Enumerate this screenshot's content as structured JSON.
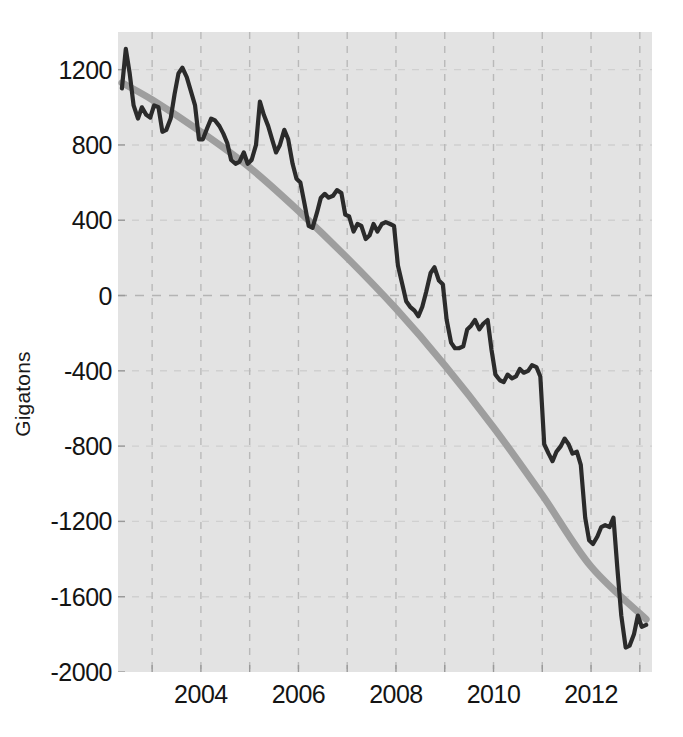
{
  "chart_data": {
    "type": "line",
    "title": "",
    "xlabel": "",
    "ylabel": "Gigatons",
    "xlim": [
      2002.3,
      2013.25
    ],
    "ylim": [
      -2000,
      1400
    ],
    "grid": true,
    "legend_position": "none",
    "x_tick_labels": [
      "2004",
      "2006",
      "2008",
      "2010",
      "2012"
    ],
    "x_tick_values": [
      2004,
      2006,
      2008,
      2010,
      2012
    ],
    "y_tick_labels": [
      "1200",
      "800",
      "400",
      "0",
      "-400",
      "-800",
      "-1200",
      "-1600",
      "-2000"
    ],
    "y_tick_values": [
      1200,
      800,
      400,
      0,
      -400,
      -800,
      -1200,
      -1600,
      -2000
    ],
    "colors": {
      "plot_background": "#e3e3e3",
      "figure_background": "#ffffff",
      "gridline": "#b9b9b9",
      "data_line": "#2b2b2b",
      "trend_line": "#9e9e9e",
      "tick_text": "#141414"
    },
    "series": [
      {
        "name": "Ice mass anomaly",
        "kind": "observed",
        "color": "#2b2b2b",
        "x": [
          2002.38,
          2002.46,
          2002.54,
          2002.62,
          2002.71,
          2002.79,
          2002.88,
          2002.96,
          2003.04,
          2003.13,
          2003.21,
          2003.29,
          2003.38,
          2003.46,
          2003.54,
          2003.62,
          2003.71,
          2003.79,
          2003.88,
          2003.96,
          2004.04,
          2004.13,
          2004.21,
          2004.29,
          2004.38,
          2004.46,
          2004.54,
          2004.62,
          2004.71,
          2004.79,
          2004.88,
          2004.96,
          2005.04,
          2005.13,
          2005.21,
          2005.29,
          2005.38,
          2005.46,
          2005.54,
          2005.62,
          2005.71,
          2005.79,
          2005.88,
          2005.96,
          2006.04,
          2006.13,
          2006.21,
          2006.29,
          2006.38,
          2006.46,
          2006.54,
          2006.62,
          2006.71,
          2006.79,
          2006.88,
          2006.96,
          2007.04,
          2007.13,
          2007.21,
          2007.29,
          2007.38,
          2007.46,
          2007.54,
          2007.62,
          2007.71,
          2007.79,
          2007.88,
          2007.96,
          2008.04,
          2008.13,
          2008.21,
          2008.29,
          2008.38,
          2008.46,
          2008.54,
          2008.62,
          2008.71,
          2008.79,
          2008.88,
          2008.96,
          2009.04,
          2009.13,
          2009.21,
          2009.29,
          2009.38,
          2009.46,
          2009.54,
          2009.62,
          2009.71,
          2009.79,
          2009.88,
          2009.96,
          2010.04,
          2010.13,
          2010.21,
          2010.29,
          2010.38,
          2010.46,
          2010.54,
          2010.62,
          2010.71,
          2010.79,
          2010.88,
          2010.96,
          2011.04,
          2011.13,
          2011.21,
          2011.29,
          2011.38,
          2011.46,
          2011.54,
          2011.62,
          2011.71,
          2011.79,
          2011.88,
          2011.96,
          2012.04,
          2012.13,
          2012.21,
          2012.29,
          2012.38,
          2012.46,
          2012.54,
          2012.62,
          2012.71,
          2012.79,
          2012.88,
          2012.96,
          2013.04,
          2013.13
        ],
        "y": [
          1100,
          1310,
          1180,
          1010,
          940,
          1000,
          960,
          945,
          1010,
          1000,
          870,
          880,
          940,
          1070,
          1180,
          1210,
          1160,
          1090,
          1010,
          830,
          830,
          890,
          940,
          930,
          900,
          860,
          810,
          720,
          700,
          710,
          760,
          700,
          720,
          800,
          1030,
          960,
          900,
          830,
          760,
          800,
          880,
          830,
          700,
          620,
          600,
          480,
          370,
          360,
          440,
          520,
          540,
          520,
          530,
          560,
          545,
          430,
          420,
          340,
          380,
          370,
          300,
          320,
          380,
          340,
          380,
          390,
          380,
          370,
          160,
          60,
          -30,
          -60,
          -80,
          -110,
          -60,
          20,
          120,
          150,
          80,
          60,
          -130,
          -250,
          -280,
          -280,
          -270,
          -180,
          -160,
          -130,
          -180,
          -150,
          -130,
          -290,
          -420,
          -450,
          -460,
          -420,
          -440,
          -430,
          -390,
          -410,
          -400,
          -370,
          -380,
          -430,
          -790,
          -840,
          -880,
          -830,
          -800,
          -760,
          -790,
          -840,
          -830,
          -900,
          -1180,
          -1300,
          -1320,
          -1280,
          -1230,
          -1220,
          -1230,
          -1180,
          -1450,
          -1700,
          -1870,
          -1860,
          -1800,
          -1700,
          -1760,
          -1750
        ]
      },
      {
        "name": "Quadratic trend",
        "kind": "trend",
        "color": "#9e9e9e",
        "x": [
          2002.38,
          2003.0,
          2004.0,
          2005.0,
          2006.0,
          2007.0,
          2008.0,
          2009.0,
          2010.0,
          2011.0,
          2012.0,
          2013.13
        ],
        "y": [
          1130,
          1040,
          870,
          680,
          450,
          200,
          -70,
          -370,
          -700,
          -1060,
          -1440,
          -1720
        ]
      }
    ],
    "annotations": []
  },
  "axis": {
    "y_title": "Gigatons"
  }
}
